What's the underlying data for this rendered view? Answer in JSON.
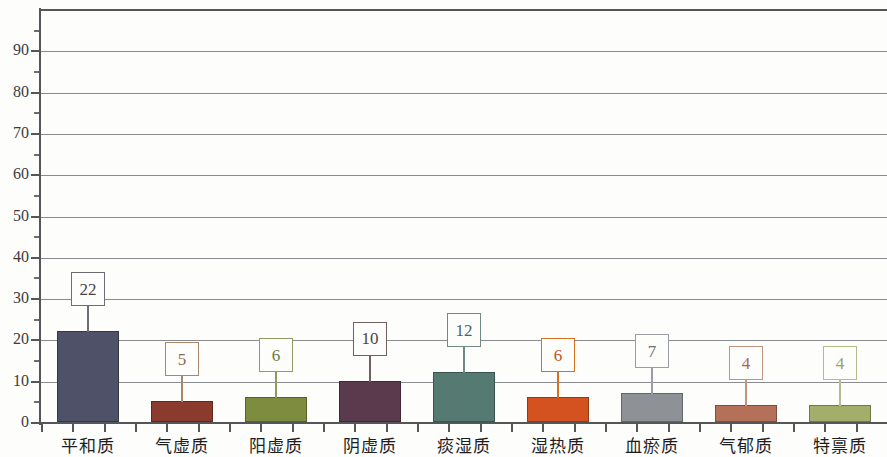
{
  "chart_data": {
    "type": "bar",
    "title": "",
    "subtitle": "",
    "xlabel": "",
    "ylabel": "",
    "ylim": [
      0,
      100
    ],
    "ytick_step": 10,
    "yticks": [
      0,
      10,
      20,
      30,
      40,
      50,
      60,
      70,
      80,
      90
    ],
    "ytick_labels": [
      "0",
      "10",
      "20",
      "30",
      "40",
      "50",
      "60",
      "70",
      "80",
      "90"
    ],
    "minor_tick_step": 5,
    "grid": "horizontal",
    "legend": "none",
    "categories": [
      "平和质",
      "气虚质",
      "阳虚质",
      "阴虚质",
      "痰湿质",
      "湿热质",
      "血瘀质",
      "气郁质",
      "特禀质"
    ],
    "values": [
      22,
      5,
      6,
      10,
      12,
      6,
      7,
      4,
      4
    ],
    "data_labels": [
      "22",
      "5",
      "6",
      "10",
      "12",
      "6",
      "7",
      "4",
      "4"
    ],
    "bar_colors": [
      "#4e5168",
      "#8b3a2e",
      "#7d8c3e",
      "#5c3a4e",
      "#547a72",
      "#d4521f",
      "#8e9196",
      "#b5705a",
      "#a3ae6b"
    ],
    "label_border_colors": [
      "#6b6d73",
      "#a8886a",
      "#8f9a62",
      "#70605f",
      "#6f8a85",
      "#d4711f",
      "#9a9da1",
      "#c2957f",
      "#b3bb86"
    ],
    "label_text_colors": [
      "#45464a",
      "#8a6a4e",
      "#6f7a46",
      "#4f4244",
      "#4e6360",
      "#c2541a",
      "#6d7074",
      "#a46a52",
      "#97a06a"
    ]
  },
  "axis": {
    "y_axis_color": "#55565a",
    "gridline_color": "#8a8b8e",
    "baseline_color": "#55565a"
  },
  "background": {
    "page_color": "#fdfdfb"
  }
}
